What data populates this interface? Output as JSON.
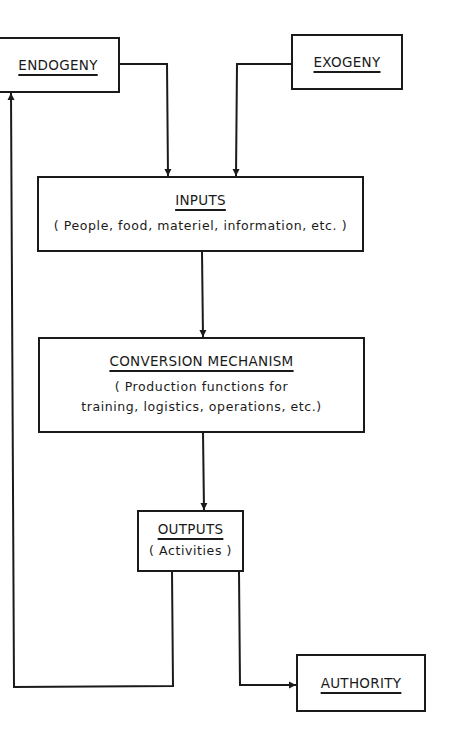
{
  "diagram": {
    "nodes": {
      "endogeny": {
        "title": "ENDOGENY"
      },
      "exogeny": {
        "title": "EXOGENY"
      },
      "inputs": {
        "title": "INPUTS",
        "subtitle": "( People, food, materiel, information, etc. )"
      },
      "conversion": {
        "title": "CONVERSION MECHANISM",
        "subtitle_line1": "( Production functions for",
        "subtitle_line2": "training, logistics, operations, etc.)"
      },
      "outputs": {
        "title": "OUTPUTS",
        "subtitle": "( Activities )"
      },
      "authority": {
        "title": "AUTHORITY"
      }
    },
    "edges": [
      {
        "from": "ENDOGENY",
        "to": "INPUTS"
      },
      {
        "from": "EXOGENY",
        "to": "INPUTS"
      },
      {
        "from": "INPUTS",
        "to": "CONVERSION MECHANISM"
      },
      {
        "from": "CONVERSION MECHANISM",
        "to": "OUTPUTS"
      },
      {
        "from": "OUTPUTS",
        "to": "ENDOGENY"
      },
      {
        "from": "OUTPUTS",
        "to": "AUTHORITY"
      }
    ],
    "line_color": "#1a1a1a"
  }
}
